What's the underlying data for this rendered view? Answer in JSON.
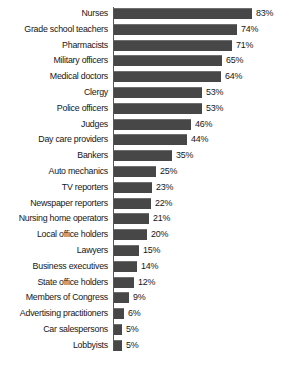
{
  "chart_data": {
    "type": "bar",
    "orientation": "horizontal",
    "title": "",
    "subtitle": "",
    "xlabel": "",
    "ylabel": "",
    "xlim": [
      0,
      83
    ],
    "grid": false,
    "legend": false,
    "value_suffix": "%",
    "bar_color": "#474747",
    "background_color": "#ffffff",
    "text_color": "#161616",
    "categories": [
      "Nurses",
      "Grade school teachers",
      "Pharmacists",
      "Military officers",
      "Medical doctors",
      "Clergy",
      "Police officers",
      "Judges",
      "Day care providers",
      "Bankers",
      "Auto mechanics",
      "TV reporters",
      "Newspaper reporters",
      "Nursing home operators",
      "Local office holders",
      "Lawyers",
      "Business executives",
      "State office holders",
      "Members of Congress",
      "Advertising practitioners",
      "Car salespersons",
      "Lobbyists"
    ],
    "values": [
      83,
      74,
      71,
      65,
      64,
      53,
      53,
      46,
      44,
      35,
      25,
      23,
      22,
      21,
      20,
      15,
      14,
      12,
      9,
      6,
      5,
      5
    ],
    "value_labels": [
      "83%",
      "74%",
      "71%",
      "65%",
      "64%",
      "53%",
      "53%",
      "46%",
      "44%",
      "35%",
      "25%",
      "23%",
      "22%",
      "21%",
      "20%",
      "15%",
      "14%",
      "12%",
      "9%",
      "6%",
      "5%",
      "5%"
    ]
  },
  "layout": {
    "axis_x": 113,
    "first_row_top": 8,
    "row_pitch": 15.8,
    "bar_height": 11,
    "px_per_unit": 1.665,
    "value_gap": 4
  }
}
